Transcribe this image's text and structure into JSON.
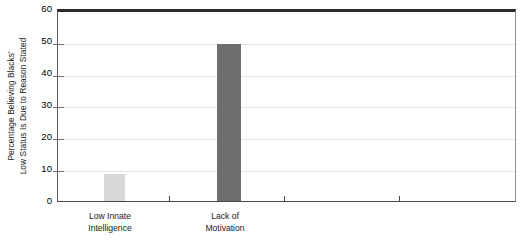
{
  "chart_data": {
    "type": "bar",
    "title": "",
    "subtitle": "",
    "xlabel": "",
    "ylabel_lines": [
      "Percentage Believing Blacks'",
      "Low Status Is Due to Reason Stated"
    ],
    "ylabel": "Percentage Believing Blacks' Low Status Is Due to Reason Stated",
    "ylim": [
      0,
      60
    ],
    "ytick_labels": [
      "0",
      "10",
      "20",
      "30",
      "40",
      "50",
      "60"
    ],
    "ytick_values": [
      0,
      10,
      20,
      30,
      40,
      50,
      60
    ],
    "grid": true,
    "legend": "none",
    "categories": [
      {
        "label_lines": [
          "Low Innate",
          "Intelligence"
        ],
        "label": "Low Innate Intelligence",
        "value": 8.5,
        "color": "#d8d8d8"
      },
      {
        "label_lines": [
          "Lack of",
          "Motivation"
        ],
        "label": "Lack of Motivation",
        "value": 50,
        "color": "#6e6e6e"
      },
      {
        "label_lines": [],
        "label": "",
        "value": null,
        "color": ""
      },
      {
        "label_lines": [],
        "label": "",
        "value": null,
        "color": ""
      }
    ],
    "values": [
      8.5,
      50,
      null,
      null
    ],
    "colors": {
      "bar_light": "#d8d8d8",
      "bar_dark": "#6e6e6e",
      "gridline": "#e3e3e3",
      "axis": "#4a4a4a",
      "frame_top": "#2b2b2b",
      "text": "#1a1a1a",
      "background": "#ffffff"
    }
  }
}
